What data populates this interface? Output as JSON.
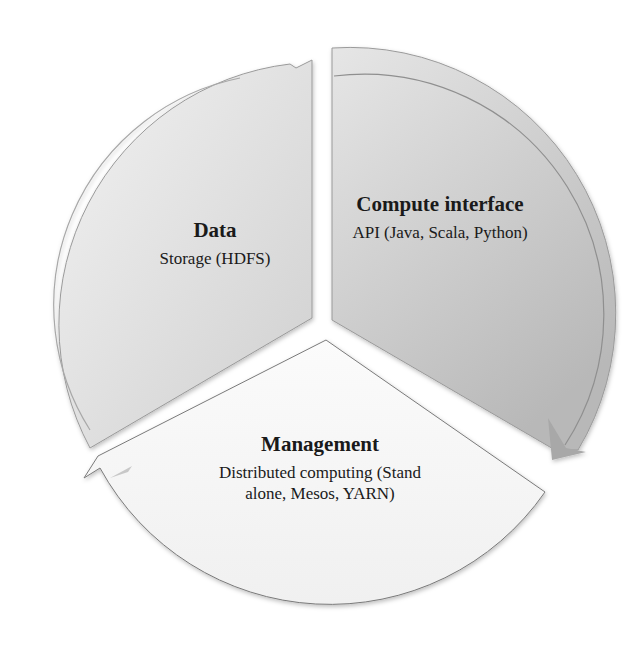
{
  "diagram": {
    "type": "cycle",
    "segments": [
      {
        "id": "data",
        "title": "Data",
        "description": "Storage (HDFS)",
        "fill": "#d9d9d9"
      },
      {
        "id": "compute",
        "title": "Compute interface",
        "description": "API (Java, Scala, Python)",
        "fill": "#c4c4c4"
      },
      {
        "id": "management",
        "title": "Management",
        "description": "Distributed computing (Stand alone, Mesos, YARN)",
        "fill": "#f3f3f3"
      }
    ],
    "colors": {
      "background": "#ffffff",
      "text": "#1a1a1a",
      "outline": "#7a7a7a"
    }
  }
}
